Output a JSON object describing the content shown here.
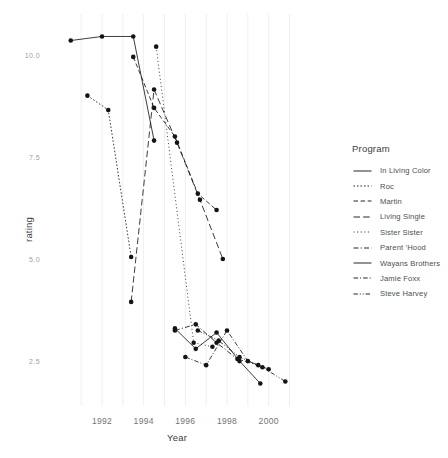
{
  "chart_data": {
    "type": "line",
    "title": "",
    "xlabel": "Year",
    "ylabel": "rating",
    "xlim": [
      1989.6,
      2001.6
    ],
    "ylim": [
      1.4,
      11.0
    ],
    "xticks": [
      1992,
      1994,
      1996,
      1998,
      2000
    ],
    "xtick_labels": [
      "1992",
      "1994",
      "1996",
      "1998",
      "2000"
    ],
    "yticks": [
      2.5,
      5.0,
      7.5,
      10.0
    ],
    "ytick_labels": [
      "2.5",
      "5.0",
      "7.5",
      "10.0"
    ],
    "grid": "vertical-only",
    "legend_position": "right",
    "legend_title": "Program",
    "marker": "filled-circle",
    "series": [
      {
        "name": "In Living Color",
        "dash": "solid",
        "x": [
          1990.5,
          1992.0,
          1993.5,
          1994.5
        ],
        "y": [
          10.35,
          10.45,
          10.45,
          7.9
        ]
      },
      {
        "name": "Roc",
        "dash": "dotted-short",
        "x": [
          1991.3,
          1992.3,
          1993.4
        ],
        "y": [
          9.0,
          8.65,
          5.05
        ]
      },
      {
        "name": "Martin",
        "dash": "dashed",
        "x": [
          1993.5,
          1994.5,
          1995.5,
          1996.6,
          1997.5
        ],
        "y": [
          9.95,
          8.7,
          8.0,
          6.6,
          6.2
        ]
      },
      {
        "name": "Living Single",
        "dash": "long-dash",
        "x": [
          1993.4,
          1994.5,
          1995.6,
          1996.7,
          1997.8
        ],
        "y": [
          3.95,
          9.15,
          7.85,
          6.45,
          5.0
        ]
      },
      {
        "name": "Sister Sister",
        "dash": "dotted",
        "x": [
          1994.6,
          1996.4,
          1997.3
        ],
        "y": [
          10.2,
          2.95,
          2.85
        ]
      },
      {
        "name": "Parent 'Hood",
        "dash": "dash-dot",
        "x": [
          1995.5,
          1996.5,
          1997.5,
          1998.5,
          1999.5
        ],
        "y": [
          3.25,
          3.4,
          2.95,
          2.55,
          2.4
        ]
      },
      {
        "name": "Wayans Brothers",
        "dash": "solid-short",
        "x": [
          1995.5,
          1996.5,
          1997.5,
          1998.6,
          1999.6
        ],
        "y": [
          3.3,
          2.8,
          3.2,
          2.5,
          1.95
        ]
      },
      {
        "name": "Jamie Foxx",
        "dash": "dash-dot-2",
        "x": [
          1996.0,
          1997.0,
          1998.0,
          1999.0,
          2000.0
        ],
        "y": [
          2.6,
          2.4,
          3.25,
          2.5,
          2.3
        ]
      },
      {
        "name": "Steve Harvey",
        "dash": "dash-dot-dot",
        "x": [
          1996.6,
          1997.6,
          1998.6,
          1999.7,
          2000.8
        ],
        "y": [
          3.25,
          3.0,
          2.6,
          2.35,
          2.0
        ]
      }
    ]
  },
  "legend": {
    "title": "Program"
  }
}
